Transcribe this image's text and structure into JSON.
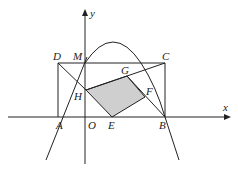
{
  "diagram": {
    "type": "coordinate-geometry",
    "colors": {
      "line": "#222222",
      "shade": "#cfcfcf",
      "background": "#ffffff"
    },
    "axes": {
      "x_label": "x",
      "y_label": "y",
      "origin_label": "O"
    },
    "points": {
      "A": {
        "label": "A",
        "x": 58,
        "y": 117
      },
      "B": {
        "label": "B",
        "x": 165,
        "y": 117
      },
      "C": {
        "label": "C",
        "x": 165,
        "y": 63
      },
      "D": {
        "label": "D",
        "x": 58,
        "y": 63
      },
      "M": {
        "label": "M",
        "x": 85,
        "y": 63
      },
      "O": {
        "label": "O",
        "x": 85,
        "y": 117
      },
      "E": {
        "label": "E",
        "x": 112,
        "y": 117
      },
      "F": {
        "label": "F",
        "x": 145,
        "y": 97
      },
      "G": {
        "label": "G",
        "x": 127,
        "y": 76
      },
      "H": {
        "label": "H",
        "x": 86,
        "y": 90
      }
    },
    "shaded_region": [
      "E",
      "F",
      "G",
      "H"
    ]
  }
}
